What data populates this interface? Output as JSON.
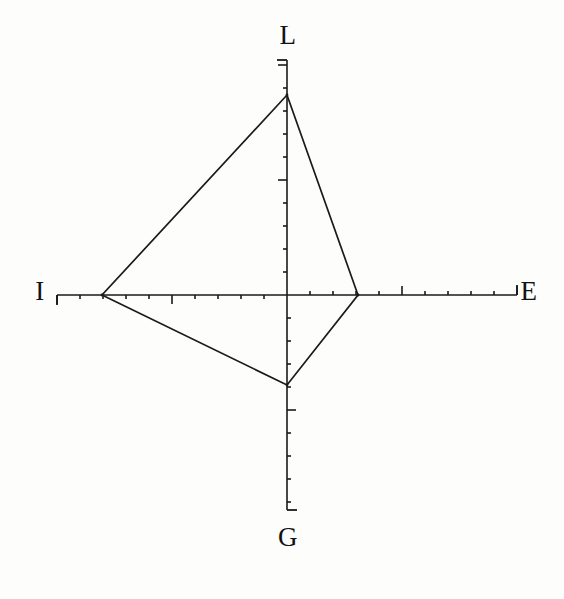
{
  "figure": {
    "background_color": "#fdfdfb",
    "line_color": "#1a1a1a",
    "title": ""
  },
  "axis_labels": {
    "top": "L",
    "right": "E",
    "bottom": "G",
    "left": "I"
  },
  "chart_data": {
    "type": "radar",
    "title": "",
    "xlabel": "",
    "ylabel": "",
    "grid": false,
    "legend_position": "none",
    "axes": [
      {
        "name": "L",
        "label": "L",
        "direction": "up",
        "angle_deg": 90,
        "axis_length_units": 10,
        "major_tick_every": 5,
        "minor_tick_every": 1
      },
      {
        "name": "E",
        "label": "E",
        "direction": "right",
        "angle_deg": 0,
        "axis_length_units": 10,
        "major_tick_every": 5,
        "minor_tick_every": 1
      },
      {
        "name": "G",
        "label": "G",
        "direction": "down",
        "angle_deg": 270,
        "axis_length_units": 10,
        "major_tick_every": 5,
        "minor_tick_every": 1
      },
      {
        "name": "I",
        "label": "I",
        "direction": "left",
        "angle_deg": 180,
        "axis_length_units": 10,
        "major_tick_every": 5,
        "minor_tick_every": 1
      }
    ],
    "categories": [
      "L",
      "E",
      "G",
      "I"
    ],
    "series": [
      {
        "name": "profile",
        "values": [
          8.7,
          3.1,
          3.9,
          8.0
        ],
        "filled": false,
        "line_color": "#1a1a1a"
      }
    ],
    "rlim": [
      0,
      10
    ],
    "annotations": []
  },
  "geometry": {
    "origin": {
      "x": 287,
      "y": 295
    },
    "axis_extent_px": {
      "up": 235,
      "right": 230,
      "down": 215,
      "left": 230
    },
    "vertices_px": [
      {
        "axis": "L",
        "x": 287,
        "y": 95
      },
      {
        "axis": "E",
        "x": 358,
        "y": 295
      },
      {
        "axis": "G",
        "x": 287,
        "y": 385
      },
      {
        "axis": "I",
        "x": 102,
        "y": 295
      }
    ],
    "tick_spacing_px": 23,
    "minor_tick_len_px": 4,
    "major_tick_len_px": 9,
    "end_cap_len_px": 10
  }
}
